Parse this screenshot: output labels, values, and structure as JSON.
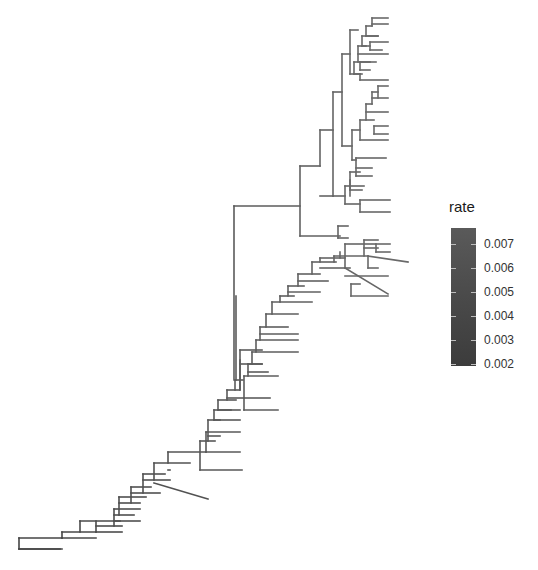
{
  "legend": {
    "title": "rate",
    "ticks": [
      {
        "label": "0.007",
        "y": 16
      },
      {
        "label": "0.006",
        "y": 40
      },
      {
        "label": "0.005",
        "y": 64
      },
      {
        "label": "0.004",
        "y": 88
      },
      {
        "label": "0.003",
        "y": 112
      },
      {
        "label": "0.002",
        "y": 136
      }
    ],
    "colors": {
      "high": "#5a5a5a",
      "low": "#3c3c3c"
    }
  },
  "tree": {
    "stroke_width": 1.6,
    "segments": [
      [
        19,
        538,
        19,
        549
      ],
      [
        19,
        538,
        62,
        538
      ],
      [
        19,
        549,
        62,
        549
      ],
      [
        62,
        532,
        62,
        538
      ],
      [
        62,
        532,
        96,
        532
      ],
      [
        62,
        538,
        96,
        538
      ],
      [
        19,
        549,
        60,
        549
      ],
      [
        80,
        521,
        80,
        532
      ],
      [
        80,
        521,
        120,
        521
      ],
      [
        96,
        521,
        96,
        532
      ],
      [
        96,
        526,
        122,
        526
      ],
      [
        96,
        532,
        122,
        532
      ],
      [
        114,
        509,
        114,
        526
      ],
      [
        114,
        509,
        140,
        509
      ],
      [
        114,
        515,
        134,
        515
      ],
      [
        114,
        521,
        140,
        521
      ],
      [
        119,
        497,
        119,
        515
      ],
      [
        119,
        497,
        146,
        497
      ],
      [
        119,
        503,
        140,
        503
      ],
      [
        131,
        487,
        131,
        503
      ],
      [
        131,
        487,
        151,
        487
      ],
      [
        131,
        493,
        160,
        493
      ],
      [
        143,
        474,
        143,
        493
      ],
      [
        143,
        474,
        165,
        474
      ],
      [
        143,
        480,
        170,
        480
      ],
      [
        154,
        463,
        154,
        480
      ],
      [
        154,
        463,
        190,
        463
      ],
      [
        154,
        483,
        208,
        499
      ],
      [
        168,
        452,
        168,
        463
      ],
      [
        168,
        452,
        206,
        452
      ],
      [
        168,
        470,
        170,
        470
      ],
      [
        206,
        432,
        206,
        452
      ],
      [
        206,
        432,
        240,
        432
      ],
      [
        206,
        452,
        240,
        452
      ],
      [
        200,
        441,
        200,
        470
      ],
      [
        200,
        441,
        215,
        441
      ],
      [
        200,
        470,
        242,
        470
      ],
      [
        208,
        420,
        208,
        441
      ],
      [
        208,
        420,
        220,
        420
      ],
      [
        208,
        436,
        220,
        436
      ],
      [
        214,
        410,
        214,
        420
      ],
      [
        214,
        410,
        231,
        410
      ],
      [
        214,
        420,
        240,
        420
      ],
      [
        218,
        400,
        218,
        410
      ],
      [
        218,
        400,
        236,
        400
      ],
      [
        218,
        410,
        240,
        410
      ],
      [
        227,
        390,
        227,
        400
      ],
      [
        227,
        390,
        239,
        390
      ],
      [
        227,
        398,
        244,
        398
      ],
      [
        235,
        380,
        235,
        390
      ],
      [
        235,
        380,
        243,
        380
      ],
      [
        240,
        350,
        240,
        390
      ],
      [
        240,
        350,
        262,
        350
      ],
      [
        240,
        364,
        262,
        364
      ],
      [
        234,
        206,
        234,
        380
      ],
      [
        236,
        296,
        236,
        380
      ],
      [
        240,
        360,
        240,
        390
      ],
      [
        244,
        376,
        244,
        410
      ],
      [
        244,
        376,
        278,
        376
      ],
      [
        244,
        398,
        270,
        398
      ],
      [
        244,
        410,
        278,
        410
      ],
      [
        248,
        364,
        248,
        376
      ],
      [
        248,
        364,
        262,
        364
      ],
      [
        248,
        372,
        268,
        372
      ],
      [
        252,
        352,
        252,
        364
      ],
      [
        252,
        352,
        298,
        352
      ],
      [
        256,
        340,
        256,
        352
      ],
      [
        256,
        340,
        298,
        340
      ],
      [
        260,
        327,
        260,
        340
      ],
      [
        260,
        327,
        288,
        327
      ],
      [
        260,
        334,
        298,
        334
      ],
      [
        266,
        314,
        266,
        327
      ],
      [
        266,
        314,
        298,
        314
      ],
      [
        272,
        302,
        272,
        314
      ],
      [
        272,
        302,
        312,
        302
      ],
      [
        280,
        296,
        280,
        302
      ],
      [
        280,
        296,
        294,
        296
      ],
      [
        288,
        286,
        288,
        296
      ],
      [
        288,
        286,
        304,
        286
      ],
      [
        288,
        292,
        320,
        292
      ],
      [
        298,
        274,
        298,
        286
      ],
      [
        298,
        274,
        320,
        274
      ],
      [
        298,
        281,
        328,
        281
      ],
      [
        312,
        262,
        312,
        274
      ],
      [
        312,
        262,
        336,
        262
      ],
      [
        320,
        258,
        320,
        262
      ],
      [
        320,
        258,
        345,
        258
      ],
      [
        320,
        268,
        350,
        268
      ],
      [
        334,
        256,
        334,
        262
      ],
      [
        334,
        256,
        368,
        256
      ],
      [
        340,
        252,
        340,
        258
      ],
      [
        345,
        244,
        345,
        268
      ],
      [
        345,
        244,
        375,
        244
      ],
      [
        345,
        276,
        388,
        276
      ],
      [
        345,
        268,
        388,
        294
      ],
      [
        364,
        240,
        364,
        256
      ],
      [
        364,
        240,
        378,
        240
      ],
      [
        364,
        248,
        378,
        248
      ],
      [
        368,
        256,
        368,
        268
      ],
      [
        368,
        256,
        408,
        262
      ],
      [
        368,
        268,
        378,
        268
      ],
      [
        376,
        244,
        376,
        252
      ],
      [
        376,
        244,
        390,
        244
      ],
      [
        376,
        252,
        390,
        252
      ],
      [
        351,
        284,
        351,
        296
      ],
      [
        351,
        284,
        360,
        284
      ],
      [
        351,
        296,
        388,
        296
      ],
      [
        234,
        206,
        300,
        206
      ],
      [
        300,
        166,
        300,
        236
      ],
      [
        300,
        166,
        320,
        166
      ],
      [
        300,
        236,
        340,
        236
      ],
      [
        320,
        130,
        320,
        166
      ],
      [
        320,
        130,
        333,
        130
      ],
      [
        320,
        196,
        333,
        196
      ],
      [
        333,
        92,
        333,
        196
      ],
      [
        333,
        92,
        342,
        92
      ],
      [
        333,
        196,
        345,
        196
      ],
      [
        345,
        186,
        345,
        204
      ],
      [
        345,
        186,
        364,
        186
      ],
      [
        345,
        204,
        360,
        204
      ],
      [
        360,
        200,
        360,
        212
      ],
      [
        360,
        200,
        390,
        200
      ],
      [
        360,
        212,
        390,
        212
      ],
      [
        338,
        226,
        338,
        238
      ],
      [
        338,
        226,
        348,
        226
      ],
      [
        338,
        238,
        348,
        238
      ],
      [
        342,
        54,
        342,
        146
      ],
      [
        342,
        54,
        350,
        54
      ],
      [
        342,
        146,
        352,
        146
      ],
      [
        350,
        180,
        350,
        196
      ],
      [
        350,
        172,
        350,
        190
      ],
      [
        350,
        172,
        360,
        172
      ],
      [
        350,
        190,
        362,
        190
      ],
      [
        356,
        158,
        356,
        176
      ],
      [
        356,
        158,
        386,
        158
      ],
      [
        356,
        168,
        372,
        168
      ],
      [
        356,
        176,
        372,
        176
      ],
      [
        352,
        130,
        352,
        160
      ],
      [
        352,
        130,
        360,
        130
      ],
      [
        352,
        160,
        356,
        160
      ],
      [
        360,
        120,
        360,
        140
      ],
      [
        360,
        120,
        374,
        120
      ],
      [
        360,
        140,
        388,
        140
      ],
      [
        366,
        104,
        366,
        120
      ],
      [
        366,
        104,
        372,
        104
      ],
      [
        366,
        112,
        388,
        112
      ],
      [
        372,
        92,
        372,
        104
      ],
      [
        372,
        92,
        378,
        92
      ],
      [
        372,
        98,
        388,
        98
      ],
      [
        374,
        126,
        374,
        134
      ],
      [
        374,
        126,
        388,
        126
      ],
      [
        374,
        134,
        388,
        134
      ],
      [
        378,
        86,
        378,
        98
      ],
      [
        378,
        86,
        388,
        86
      ],
      [
        350,
        30,
        350,
        74
      ],
      [
        350,
        30,
        358,
        30
      ],
      [
        350,
        74,
        360,
        74
      ],
      [
        354,
        62,
        354,
        74
      ],
      [
        354,
        62,
        370,
        62
      ],
      [
        354,
        74,
        362,
        74
      ],
      [
        358,
        46,
        358,
        62
      ],
      [
        358,
        46,
        366,
        46
      ],
      [
        358,
        54,
        388,
        54
      ],
      [
        362,
        36,
        362,
        46
      ],
      [
        362,
        36,
        378,
        36
      ],
      [
        362,
        46,
        370,
        46
      ],
      [
        366,
        26,
        366,
        36
      ],
      [
        366,
        26,
        372,
        26
      ],
      [
        366,
        36,
        378,
        36
      ],
      [
        372,
        18,
        372,
        26
      ],
      [
        372,
        18,
        388,
        18
      ],
      [
        372,
        24,
        388,
        24
      ],
      [
        370,
        42,
        370,
        50
      ],
      [
        370,
        42,
        388,
        42
      ],
      [
        370,
        50,
        382,
        50
      ],
      [
        360,
        62,
        360,
        70
      ],
      [
        360,
        62,
        376,
        62
      ],
      [
        360,
        70,
        370,
        70
      ],
      [
        360,
        80,
        360,
        74
      ],
      [
        360,
        80,
        388,
        80
      ]
    ]
  }
}
